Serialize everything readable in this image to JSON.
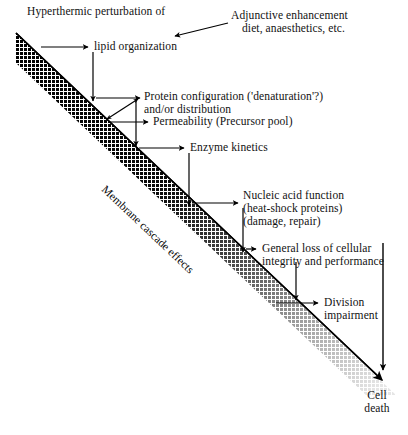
{
  "figure": {
    "band_label": "Membrane cascade effects",
    "colors": {
      "ink": "#000000",
      "band_dark": "#111111",
      "band_light": "#cfcfcf",
      "background": "#ffffff"
    }
  },
  "labels": {
    "top_left_line1": "Hyperthermic perturbation of",
    "lipid_organization": "lipid organization",
    "adjunctive_line1": "Adjunctive enhancement",
    "adjunctive_line2": "diet, anaesthetics, etc.",
    "protein_line1": "Protein configuration ('denaturation'?)",
    "protein_line2": "and/or distribution",
    "permeability": "Permeability (Precursor pool)",
    "enzyme_kinetics": "Enzyme kinetics",
    "nucleic_line1": "Nucleic acid function",
    "nucleic_line2": "(heat-shock proteins)",
    "nucleic_line3": "(damage, repair)",
    "general_loss_line1": "General loss of cellular",
    "general_loss_line2": "integrity and performance",
    "division_line1": "Division",
    "division_line2": "impairment",
    "cell_death_line1": "Cell",
    "cell_death_line2": "death"
  },
  "flow": {
    "steps": [
      "lipid organization",
      "Protein configuration ('denaturation'?) and/or distribution",
      "Permeability (Precursor pool)",
      "Enzyme kinetics",
      "Nucleic acid function (heat-shock proteins) (damage, repair)",
      "General loss of cellular integrity and performance",
      "Division impairment",
      "Cell death"
    ],
    "modifiers": [
      "Adjunctive enhancement diet, anaesthetics, etc."
    ]
  }
}
